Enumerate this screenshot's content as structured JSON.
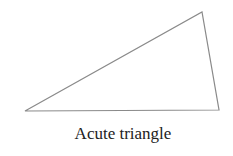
{
  "diagram": {
    "caption": "Acute triangle",
    "shape": "triangle",
    "vertices": [
      [
        25,
        111
      ],
      [
        202,
        12
      ],
      [
        219,
        110
      ]
    ],
    "stroke_color": "#8a8a8a",
    "background": "#ffffff"
  }
}
